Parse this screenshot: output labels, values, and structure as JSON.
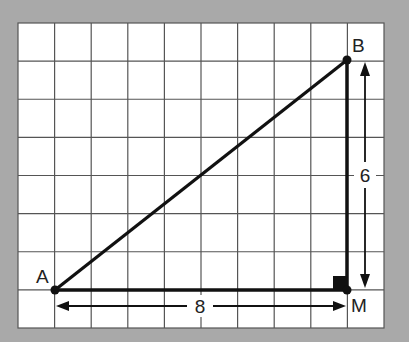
{
  "figure": {
    "type": "right-triangle-on-grid",
    "background_color": "#a9a9a9",
    "grid_color": "#555555",
    "grid": {
      "columns": 10,
      "rows": 8
    },
    "points": [
      {
        "label": "A",
        "grid_x": 1,
        "grid_y": 1
      },
      {
        "label": "B",
        "grid_x": 9,
        "grid_y": 7
      },
      {
        "label": "M",
        "grid_x": 9,
        "grid_y": 1
      }
    ],
    "segments": [
      "AB",
      "AM",
      "BM"
    ],
    "right_angle_at": "M",
    "dimensions": [
      {
        "label": "8",
        "between": "A-M",
        "orientation": "horizontal"
      },
      {
        "label": "6",
        "between": "B-M",
        "orientation": "vertical"
      }
    ]
  },
  "labels": {
    "A": "A",
    "B": "B",
    "M": "M",
    "horizontal_length": "8",
    "vertical_length": "6"
  }
}
